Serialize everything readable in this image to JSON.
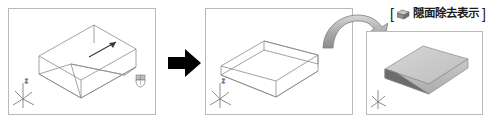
{
  "figure": {
    "type": "cad-tutorial-sequence",
    "background_color": "#ffffff",
    "panel_border_color": "#b9b9b9"
  },
  "caption": {
    "open_bracket": "[",
    "close_bracket": "]",
    "icon_name": "shaded-box-icon",
    "text": "隠面除去表示"
  },
  "panels": [
    {
      "id": "panel-1",
      "name": "wireframe-box-with-wedge-viewport",
      "ucs_icon": "ucs-axis-tripod-icon",
      "extras": [
        "mouse-cursor-icon",
        "pick-arrow-icon"
      ]
    },
    {
      "id": "panel-2",
      "name": "wireframe-wedge-viewport",
      "ucs_icon": "ucs-axis-tripod-icon",
      "extras": []
    },
    {
      "id": "panel-3",
      "name": "shaded-wedge-viewport",
      "ucs_icon": "ucs-axis-tripod-icon",
      "extras": []
    }
  ],
  "arrows": {
    "step": {
      "name": "step-right-arrow",
      "color": "#000000",
      "direction": "right"
    },
    "curve": {
      "name": "curved-3d-arrow",
      "color": "#9a9a9a",
      "direction": "left-to-right-down"
    }
  },
  "colors": {
    "line": "#7d7d7d",
    "solid_light": "#cfcfcf",
    "solid_mid": "#b4b4b4",
    "solid_dark": "#6f6f6f",
    "text": "#1b1b1b"
  }
}
